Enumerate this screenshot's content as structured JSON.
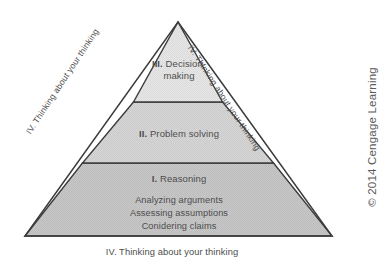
{
  "figure": {
    "name": "critical-thinking-pyramid",
    "background_color": "#ffffff",
    "outline_color": "#3c3c3c"
  },
  "pyramid": {
    "apex": {
      "x": 178,
      "y": 22
    },
    "base_left": {
      "x": 25,
      "y": 236
    },
    "base_right": {
      "x": 332,
      "y": 236
    },
    "tiers": [
      {
        "level": "III.",
        "roman": "III.",
        "label": "Decision-making",
        "line1": "III. Decision-",
        "line2": "making",
        "fill": "#e4e4e4",
        "position": "top"
      },
      {
        "level": "II.",
        "roman": "II.",
        "label": "Problem solving",
        "line1": "II. Problem solving",
        "fill": "#d4d4d4",
        "position": "middle"
      },
      {
        "level": "I.",
        "roman": "I.",
        "label": "Reasoning",
        "line1": "I. Reasoning",
        "fill": "#c6c6c6",
        "position": "base",
        "items": [
          "Analyzing arguments",
          "Assessing assumptions",
          "Conidering claims"
        ]
      }
    ],
    "divider_y": [
      102,
      163
    ]
  },
  "labels": {
    "edge_left": "IV. Thinking about your thinking",
    "edge_right": "IV. Thinking about your thinking",
    "bottom_caption": "IV. Thinking about your thinking"
  },
  "copyright": {
    "text": "© 2014 Cengage Learning"
  }
}
